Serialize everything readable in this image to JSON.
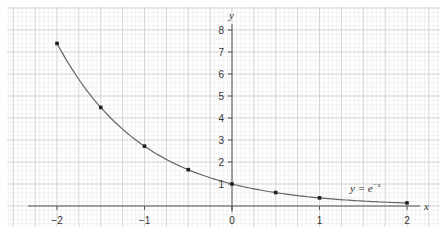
{
  "chart_data": {
    "type": "line",
    "title": "",
    "xlabel": "x",
    "ylabel": "y",
    "curve_label": "y = e",
    "curve_label_exp": "−x",
    "function": "y = e^-x",
    "xlim": [
      -2,
      2
    ],
    "ylim": [
      0,
      8
    ],
    "grid": true,
    "x_ticks": [
      "−2",
      "−1",
      "0",
      "1",
      "2"
    ],
    "x_tick_values": [
      -2,
      -1,
      0,
      1,
      2
    ],
    "y_ticks": [
      "1",
      "2",
      "3",
      "4",
      "5",
      "6",
      "7",
      "8"
    ],
    "y_tick_values": [
      1,
      2,
      3,
      4,
      5,
      6,
      7,
      8
    ],
    "series": [
      {
        "name": "y = e^-x",
        "x": [
          -2,
          -1.5,
          -1,
          -0.5,
          0,
          0.5,
          1,
          2
        ],
        "values": [
          7.39,
          4.48,
          2.72,
          1.65,
          1.0,
          0.61,
          0.37,
          0.14
        ]
      }
    ]
  },
  "colors": {
    "grid_minor": "#e6e6e6",
    "grid_major": "#c8c8c8",
    "axis": "#555555",
    "curve": "#666666",
    "point": "#222222"
  }
}
